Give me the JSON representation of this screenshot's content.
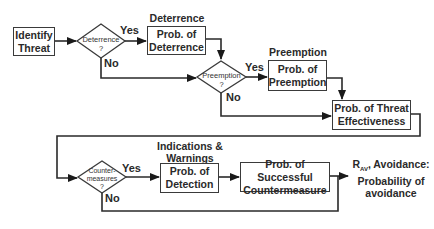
{
  "diagram": {
    "nodes": {
      "identify_threat": {
        "line1": "Identify",
        "line2": "Threat"
      },
      "deterrence_decision": {
        "line1": "Deterrence",
        "line2": "?"
      },
      "deterrence_box": {
        "title": "Deterrence",
        "line1": "Prob. of",
        "line2": "Deterrence"
      },
      "preemption_decision": {
        "line1": "Preemption",
        "line2": "?"
      },
      "preemption_box": {
        "title": "Preemption",
        "line1": "Prob. of",
        "line2": "Preemption"
      },
      "threat_effectiveness": {
        "line1": "Prob. of Threat",
        "line2": "Effectiveness"
      },
      "countermeasures_decision": {
        "line1": "Counter-",
        "line2": "measures",
        "line3": "?"
      },
      "detection_box": {
        "title_line1": "Indications &",
        "title_line2": "Warnings",
        "line1": "Prob. of",
        "line2": "Detection"
      },
      "countermeasure_box": {
        "line1": "Prob. of Successful",
        "line2": "Countermeasure"
      },
      "avoidance_output": {
        "symbol": "R",
        "subscript": "AV",
        "line1_rest": ", Avoidance:",
        "line2": "Probability of",
        "line3": "avoidance"
      }
    },
    "edge_labels": {
      "yes": "Yes",
      "no": "No"
    }
  }
}
